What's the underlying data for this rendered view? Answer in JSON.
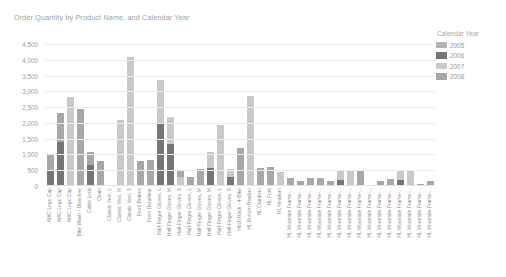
{
  "chart_data": {
    "type": "bar",
    "stacked": true,
    "title": "Order Quantity by Product Name, and Calendar Year",
    "xlabel": "",
    "ylabel": "",
    "ylim": [
      0,
      4500
    ],
    "ytick_values": [
      0,
      500,
      1000,
      1500,
      2000,
      2500,
      3000,
      3500,
      4000,
      4500
    ],
    "ytick_labels": [
      "0",
      "500",
      "1,000",
      "1,500",
      "2,000",
      "2,500",
      "3,000",
      "3,500",
      "4,000",
      "4,500"
    ],
    "grid": true,
    "legend_position": "right",
    "legend_title": "Calendar Year",
    "series": [
      {
        "name": "2005",
        "color": "#b4b4b4"
      },
      {
        "name": "2006",
        "color": "#767676"
      },
      {
        "name": "2007",
        "color": "#c9c9c9"
      },
      {
        "name": "2008",
        "color": "#a8a8a8"
      }
    ],
    "categories": [
      "AWC Logo Cap",
      "AWC Logo Cap",
      "AWC Logo Cap",
      "Bike Wash - Dissolver",
      "Cable Lock",
      "Chain",
      "Classic Vest, L",
      "Classic Vest, M",
      "Classic Vest, S",
      "Front Brakes",
      "Front Derailleur",
      "Half-Finger Gloves, L",
      "Half-Finger Gloves, M",
      "Half-Finger Gloves, S",
      "Half-Finger Gloves, L",
      "Half-Finger Gloves, M",
      "Half-Finger Gloves, M",
      "Half-Finger Gloves, L",
      "Half-Finger Gloves, S",
      "Hitch Rack - 4-Bike",
      "HL Bottom Bracket",
      "HL Crankset",
      "HL Fork",
      "HL Headset",
      "HL Mountain Frame-...",
      "HL Mountain Frame-...",
      "HL Mountain Frame-...",
      "HL Mountain Frame-...",
      "HL Mountain Frame-...",
      "HL Mountain Frame-...",
      "HL Mountain Frame-...",
      "HL Mountain Frame-...",
      "HL Mountain Frame-...",
      "HL Mountain Frame-...",
      "HL Mountain Frame-...",
      "HL Mountain Frame-...",
      "HL Mountain Frame-...",
      "HL Mountain Frame-...",
      "HL Mountain Frame-..."
    ],
    "stacks": [
      [
        0,
        500,
        0,
        500
      ],
      [
        0,
        1400,
        0,
        910
      ],
      [
        0,
        0,
        2820,
        0
      ],
      [
        0,
        0,
        0,
        2430
      ],
      [
        0,
        680,
        0,
        410
      ],
      [
        0,
        0,
        0,
        790
      ],
      [
        0,
        0,
        0,
        20
      ],
      [
        0,
        0,
        2090,
        0
      ],
      [
        0,
        0,
        4090,
        0
      ],
      [
        0,
        0,
        0,
        800
      ],
      [
        0,
        0,
        0,
        830
      ],
      [
        0,
        1950,
        1410,
        0
      ],
      [
        0,
        1320,
        870,
        0
      ],
      [
        0,
        0,
        290,
        200
      ],
      [
        0,
        0,
        0,
        290
      ],
      [
        0,
        0,
        0,
        530
      ],
      [
        0,
        570,
        500,
        0
      ],
      [
        0,
        0,
        1930,
        0
      ],
      [
        0,
        300,
        250,
        0
      ],
      [
        0,
        0,
        0,
        1210
      ],
      [
        0,
        0,
        2840,
        0
      ],
      [
        0,
        0,
        0,
        560
      ],
      [
        0,
        0,
        0,
        600
      ],
      [
        0,
        0,
        430,
        0
      ],
      [
        0,
        0,
        0,
        240
      ],
      [
        0,
        0,
        0,
        160
      ],
      [
        0,
        0,
        0,
        260
      ],
      [
        0,
        0,
        0,
        250
      ],
      [
        0,
        0,
        0,
        150
      ],
      [
        0,
        190,
        320,
        0
      ],
      [
        0,
        0,
        510,
        0
      ],
      [
        0,
        0,
        0,
        510
      ],
      [
        0,
        0,
        0,
        30
      ],
      [
        0,
        0,
        0,
        160
      ],
      [
        0,
        0,
        0,
        210
      ],
      [
        0,
        180,
        340,
        0
      ],
      [
        0,
        0,
        520,
        0
      ],
      [
        0,
        0,
        0,
        70
      ],
      [
        0,
        0,
        0,
        150
      ]
    ]
  }
}
